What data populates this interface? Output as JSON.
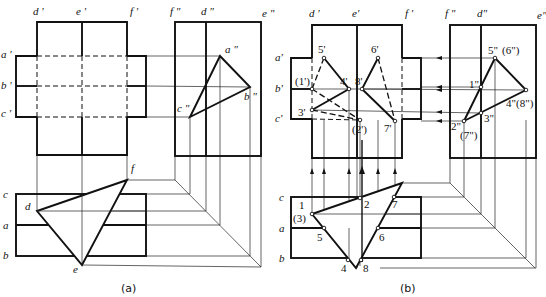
{
  "figure": {
    "panel_a": {
      "caption": "(a)",
      "front_view_labels": {
        "d": "d '",
        "e": "e '",
        "f": "f '",
        "a": "a '",
        "b": "b '",
        "c": "c '"
      },
      "side_view_labels": {
        "f": "f \"",
        "d": "d \"",
        "e": "e \"",
        "a": "a \"",
        "b": "b \"",
        "c": "c \""
      },
      "top_view_labels": {
        "c": "c",
        "a": "a",
        "b": "b",
        "d": "d",
        "e": "e",
        "f": "f"
      }
    },
    "panel_b": {
      "caption": "(b)",
      "front_view_labels": {
        "d": "d '",
        "e": "e'",
        "f": "f '",
        "a": "a'",
        "b": "b'",
        "c": "c'"
      },
      "side_view_labels": {
        "f": "f \"",
        "d": "d\"",
        "e": "e\""
      },
      "front_points": {
        "p1": "(1')",
        "p2": "(2')",
        "p3": "3'",
        "p4": "4'",
        "p5": "5'",
        "p6": "6'",
        "p7": "7'",
        "p8": "8'"
      },
      "side_points": {
        "p1": "1\"",
        "p2": "2\"",
        "p7": "(7\")",
        "p3": "3\"",
        "p4": "4\"(8\")",
        "p5": "5\"",
        "p6": "(6\")"
      },
      "top_labels": {
        "c": "c",
        "a": "a",
        "b": "b"
      },
      "top_points": {
        "p1": "1",
        "p3": "(3)",
        "p2": "2",
        "p7": "7",
        "p5": "5",
        "p6": "6",
        "p4": "4",
        "p8": "8"
      }
    }
  }
}
